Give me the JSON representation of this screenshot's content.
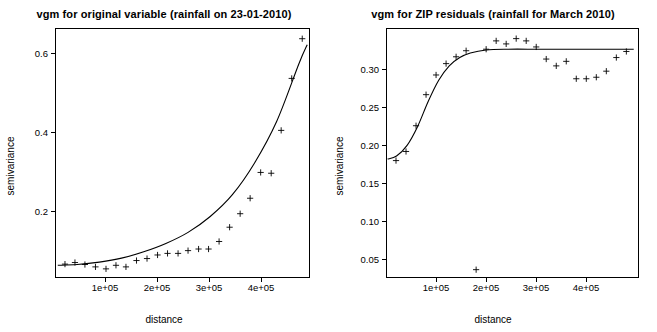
{
  "chart_data": [
    {
      "type": "scatter",
      "id": "left",
      "title": "vgm for original variable (rainfall on 23-01-2010)",
      "xlabel": "distance",
      "ylabel": "semivariance",
      "xlim": [
        0,
        460000
      ],
      "ylim": [
        0.06,
        0.69
      ],
      "xticks": [
        100000,
        200000,
        300000,
        400000
      ],
      "xticklabels": [
        "1e+05",
        "2e+05",
        "3e+05",
        "4e+05"
      ],
      "yticks": [
        0.2,
        0.4,
        0.6
      ],
      "yticklabels": [
        "0.2",
        "0.4",
        "0.6"
      ],
      "grid": false,
      "legend": "none",
      "points": {
        "x": [
          18000,
          36000,
          54000,
          73000,
          92000,
          110000,
          128000,
          147000,
          166000,
          185000,
          203000,
          222000,
          240000,
          259000,
          277000,
          296000,
          315000,
          334000,
          352000,
          371000,
          390000,
          408000,
          427000,
          446000
        ],
        "y": [
          0.095,
          0.099,
          0.094,
          0.088,
          0.083,
          0.092,
          0.088,
          0.104,
          0.109,
          0.118,
          0.122,
          0.122,
          0.129,
          0.133,
          0.133,
          0.152,
          0.188,
          0.222,
          0.261,
          0.326,
          0.324,
          0.432,
          0.563,
          0.663
        ]
      },
      "fitted_line": {
        "x": [
          5000,
          40000,
          80000,
          120000,
          160000,
          200000,
          240000,
          280000,
          320000,
          360000,
          400000,
          440000,
          455000
        ],
        "y": [
          0.092,
          0.094,
          0.1,
          0.11,
          0.126,
          0.147,
          0.175,
          0.215,
          0.27,
          0.35,
          0.455,
          0.6,
          0.648
        ]
      }
    },
    {
      "type": "scatter",
      "id": "right",
      "title": "vgm for ZIP residuals (rainfall for March 2010)",
      "xlabel": "distance",
      "ylabel": "semivariance",
      "xlim": [
        0,
        480000
      ],
      "ylim": [
        0.005,
        0.335
      ],
      "xticks": [
        100000,
        200000,
        300000,
        400000
      ],
      "xticklabels": [
        "1e+05",
        "2e+05",
        "3e+05",
        "4e+05"
      ],
      "yticks": [
        0.05,
        0.1,
        0.15,
        0.2,
        0.25,
        0.3
      ],
      "yticklabels": [
        "0.05",
        "0.10",
        "0.15",
        "0.20",
        "0.25",
        "0.30"
      ],
      "grid": false,
      "legend": "none",
      "points": {
        "x": [
          19000,
          38000,
          57000,
          76000,
          95000,
          114000,
          133000,
          152000,
          171000,
          190000,
          209000,
          228000,
          247000,
          266000,
          285000,
          304000,
          323000,
          342000,
          361000,
          380000,
          399000,
          418000,
          437000,
          456000
        ],
        "y": [
          0.16,
          0.172,
          0.206,
          0.247,
          0.273,
          0.288,
          0.297,
          0.305,
          0.016,
          0.307,
          0.318,
          0.314,
          0.321,
          0.318,
          0.31,
          0.294,
          0.285,
          0.291,
          0.268,
          0.268,
          0.27,
          0.278,
          0.296,
          0.304
        ]
      },
      "fitted_line": {
        "x": [
          3000,
          20000,
          40000,
          60000,
          80000,
          100000,
          120000,
          140000,
          160000,
          190000,
          230000,
          290000,
          350000,
          420000,
          470000
        ],
        "y": [
          0.162,
          0.166,
          0.18,
          0.205,
          0.238,
          0.266,
          0.285,
          0.296,
          0.302,
          0.306,
          0.307,
          0.307,
          0.307,
          0.307,
          0.307
        ]
      }
    }
  ]
}
